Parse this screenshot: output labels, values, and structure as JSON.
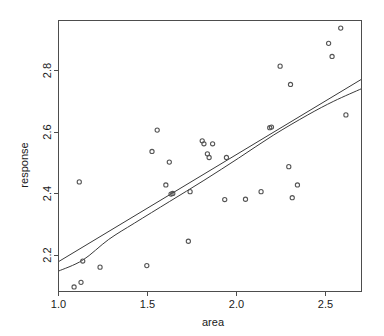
{
  "chart_data": {
    "type": "scatter",
    "title": "",
    "subtitle": "",
    "xlabel": "area",
    "ylabel": "response",
    "xlim": [
      0.96,
      2.71
    ],
    "ylim": [
      2.06,
      2.95
    ],
    "xticks": [
      "1.0",
      "1.5",
      "2.0",
      "2.5"
    ],
    "xtick_values": [
      1.0,
      1.5,
      2.0,
      2.5
    ],
    "yticks": [
      "2.2",
      "2.4",
      "2.6",
      "2.8"
    ],
    "ytick_values": [
      2.2,
      2.4,
      2.6,
      2.8
    ],
    "grid": false,
    "legend": false,
    "legend_position": "none",
    "point_marker": "open-circle",
    "series": [
      {
        "name": "observations",
        "type": "scatter",
        "x": [
          1.05,
          1.09,
          1.1,
          1.2,
          1.08,
          1.47,
          1.5,
          1.53,
          1.58,
          1.6,
          1.61,
          1.62,
          1.71,
          1.72,
          1.79,
          1.8,
          1.82,
          1.83,
          1.85,
          1.92,
          1.93,
          2.04,
          2.13,
          2.18,
          2.19,
          2.24,
          2.29,
          2.3,
          2.31,
          2.34,
          2.52,
          2.54,
          2.59,
          2.62
        ],
        "y": [
          2.075,
          2.09,
          2.16,
          2.14,
          2.42,
          2.145,
          2.52,
          2.59,
          2.41,
          2.485,
          2.38,
          2.382,
          2.225,
          2.388,
          2.555,
          2.545,
          2.512,
          2.5,
          2.545,
          2.362,
          2.5,
          2.363,
          2.388,
          2.598,
          2.6,
          2.8,
          2.47,
          2.74,
          2.368,
          2.41,
          2.875,
          2.832,
          2.925,
          2.64
        ]
      },
      {
        "name": "linear-fit",
        "type": "line",
        "x": [
          0.96,
          2.71
        ],
        "y": [
          2.158,
          2.757
        ]
      },
      {
        "name": "smooth-fit",
        "type": "line",
        "x": [
          0.96,
          1.1,
          1.25,
          1.4,
          1.6,
          1.8,
          2.0,
          2.2,
          2.4,
          2.55,
          2.71
        ],
        "y": [
          2.127,
          2.163,
          2.231,
          2.285,
          2.355,
          2.425,
          2.498,
          2.573,
          2.64,
          2.685,
          2.726
        ]
      }
    ]
  },
  "axes": {
    "x_title": "area",
    "y_title": "response"
  }
}
